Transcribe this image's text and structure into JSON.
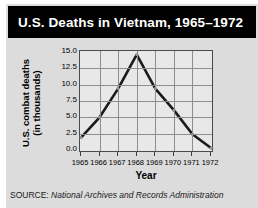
{
  "header": {
    "title": "U.S. Deaths in Vietnam, 1965–1972"
  },
  "axes": {
    "ylabel_line1": "U.S. combat deaths",
    "ylabel_line2": "(in thousands)",
    "xlabel": "Year"
  },
  "source": {
    "label": "SOURCE: ",
    "text": "National Archives and Records Administration"
  },
  "colors": {
    "title_bar": "#000000",
    "title_text": "#ffffff",
    "card_background": "#dcdcdc",
    "plot_background": "#e8e8e8",
    "grid": "#8e8e8e",
    "axis": "#4a4a4a",
    "series": "#1a1a1a"
  },
  "chart_data": {
    "type": "line",
    "title": "U.S. Deaths in Vietnam, 1965–1972",
    "xlabel": "Year",
    "ylabel": "U.S. combat deaths (in thousands)",
    "categories": [
      "1965",
      "1966",
      "1967",
      "1968",
      "1969",
      "1970",
      "1971",
      "1972"
    ],
    "x": [
      1965,
      1966,
      1967,
      1968,
      1969,
      1970,
      1971,
      1972
    ],
    "values": [
      1.9,
      5.0,
      9.4,
      14.6,
      9.4,
      6.1,
      2.4,
      0.3
    ],
    "series": [
      {
        "name": "U.S. combat deaths (in thousands)",
        "values": [
          1.9,
          5.0,
          9.4,
          14.6,
          9.4,
          6.1,
          2.4,
          0.3
        ]
      }
    ],
    "ylim": [
      0.0,
      15.0
    ],
    "yticks": [
      0.0,
      2.5,
      5.0,
      7.5,
      10.0,
      12.5,
      15.0
    ],
    "ytick_labels": [
      "0.0",
      "2.5",
      "5.0",
      "7.5",
      "10.0",
      "12.5",
      "15.0"
    ],
    "xticks": [
      1965,
      1966,
      1967,
      1968,
      1969,
      1970,
      1971,
      1972
    ],
    "xtick_labels": [
      "1965",
      "1966",
      "1967",
      "1968",
      "1969",
      "1970",
      "1971",
      "1972"
    ],
    "grid": true,
    "legend": false,
    "legend_position": "none",
    "markers": true,
    "annotations": []
  }
}
